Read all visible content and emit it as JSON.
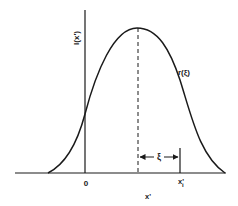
{
  "figure": {
    "y_axis_label": "I(x')",
    "curve_label": "r(ξ)",
    "origin_label": "0",
    "xi_label": "ξ",
    "xi_point_label": "x'",
    "xi_point_subscript": "i",
    "x_axis_label": "x'"
  },
  "colors": {
    "ink": "#1a1a1a",
    "background": "#ffffff"
  }
}
